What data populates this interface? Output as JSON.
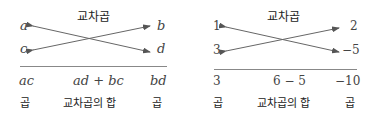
{
  "left": {
    "title": "교차곱",
    "top_left": "a",
    "bottom_left": "c",
    "top_right": "b",
    "bottom_right": "d",
    "result_left": "ac",
    "result_middle": "ad + bc",
    "result_right": "bd",
    "label_left": "곱",
    "label_middle": "교차곱의 합",
    "label_right": "곱"
  },
  "right": {
    "title": "교차곱",
    "top_left": "1",
    "bottom_left": "3",
    "top_right": "2",
    "bottom_right": "−5",
    "result_left": "3",
    "result_middle": "6 − 5",
    "result_right": "−10",
    "label_left": "곱",
    "label_middle": "교차곱의 합",
    "label_right": "곱"
  }
}
